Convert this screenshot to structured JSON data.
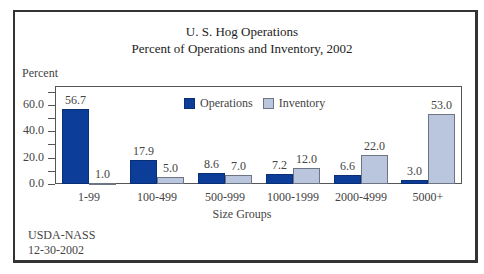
{
  "chart_data": {
    "type": "bar",
    "title": "U. S. Hog Operations",
    "subtitle": "Percent of Operations and Inventory, 2002",
    "xlabel": "Size Groups",
    "ylabel": "Percent",
    "categories": [
      "1-99",
      "100-499",
      "500-999",
      "1000-1999",
      "2000-4999",
      "5000+"
    ],
    "series": [
      {
        "name": "Operations",
        "color": "#0c3d98",
        "values": [
          56.7,
          17.9,
          8.6,
          7.2,
          6.6,
          3.0
        ],
        "labels": [
          "56.7",
          "17.9",
          "8.6",
          "7.2",
          "6.6",
          "3.0"
        ]
      },
      {
        "name": "Inventory",
        "color": "#bac6dd",
        "values": [
          1.0,
          5.0,
          7.0,
          12.0,
          22.0,
          53.0
        ],
        "labels": [
          "1.0",
          "5.0",
          "7.0",
          "12.0",
          "22.0",
          "53.0"
        ]
      }
    ],
    "yticks": [
      "0.0",
      "20.0",
      "40.0",
      "60.0"
    ],
    "ylim": [
      0,
      70
    ],
    "grid": false,
    "legend_position": "top-inside"
  },
  "footer": {
    "source": "USDA-NASS",
    "date": "12-30-2002"
  }
}
